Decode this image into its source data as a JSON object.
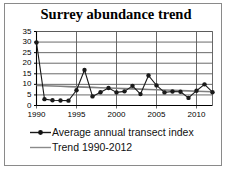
{
  "chart_data": {
    "type": "line",
    "title": "Surrey abundance trend",
    "xlabel": "",
    "ylabel": "",
    "xlim": [
      1990,
      2012
    ],
    "ylim": [
      0,
      35
    ],
    "grid": true,
    "grid_axis": "y",
    "legend_position": "bottom",
    "x_tick_labels": [
      "1990",
      "1995",
      "2000",
      "2005",
      "2010"
    ],
    "x_ticks": [
      1990,
      1995,
      2000,
      2005,
      2010
    ],
    "y_tick_labels": [
      "0",
      "5",
      "10",
      "15",
      "20",
      "25",
      "30",
      "35"
    ],
    "y_ticks": [
      0,
      5,
      10,
      15,
      20,
      25,
      30,
      35
    ],
    "x": [
      1990,
      1991,
      1992,
      1993,
      1994,
      1995,
      1996,
      1997,
      1998,
      1999,
      2000,
      2001,
      2002,
      2003,
      2004,
      2005,
      2006,
      2007,
      2008,
      2009,
      2010,
      2011,
      2012
    ],
    "series": [
      {
        "name": "Average annual transect index",
        "style": "line-with-markers",
        "color": "#1a1a1a",
        "marker": "circle",
        "values": [
          29.8,
          3.0,
          2.5,
          2.4,
          2.3,
          7.2,
          16.8,
          4.3,
          6.3,
          8.3,
          6.2,
          6.7,
          9.3,
          5.4,
          14.2,
          9.5,
          6.2,
          6.6,
          6.5,
          3.6,
          7.0,
          10.0,
          6.3
        ]
      },
      {
        "name": "Trend 1990-2012",
        "style": "line",
        "color": "#808080",
        "marker": "none",
        "values": [
          9.5,
          9.36,
          9.23,
          9.09,
          8.95,
          8.82,
          8.68,
          8.55,
          8.41,
          8.27,
          8.14,
          8.0,
          7.86,
          7.73,
          7.59,
          7.45,
          7.32,
          7.18,
          7.05,
          6.91,
          6.77,
          6.64,
          6.5
        ]
      }
    ],
    "legend_entries": [
      {
        "label": "Average annual transect index",
        "key": "line-marker"
      },
      {
        "label": "Trend 1990-2012",
        "key": "line"
      }
    ]
  },
  "figure": {
    "border_color": "#8a8a8a",
    "background": "#ffffff",
    "axis_color": "#000000",
    "grid_color": "#595959"
  }
}
